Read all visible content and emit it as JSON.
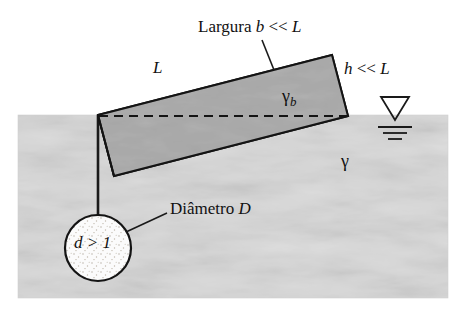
{
  "figure": {
    "kind": "hydrostatics-diagram",
    "background_color": "#ffffff",
    "water_fill_color": "#d8d8d8",
    "gate_fill_color": "#a8a8a8",
    "sphere_fill_color": "#fbfbfb",
    "line_color": "#1a1a1a"
  },
  "labels": {
    "width_label": {
      "text": "Largura",
      "variable": "b",
      "relation": "<<",
      "reference": "L",
      "full": "Largura b << L"
    },
    "length_label": {
      "text": "L"
    },
    "thickness_label": {
      "variable": "h",
      "relation": "<<",
      "reference": "L",
      "full": "h << L"
    },
    "gate_specific_weight": {
      "symbol": "γ",
      "subscript": "b"
    },
    "fluid_specific_weight": {
      "symbol": "γ"
    },
    "diameter_label": {
      "text": "Diâmetro",
      "variable": "D",
      "full": "Diâmetro D"
    },
    "sphere_density_label": {
      "text": "d > 1"
    },
    "free_surface_symbol": "free-surface-triangle"
  }
}
